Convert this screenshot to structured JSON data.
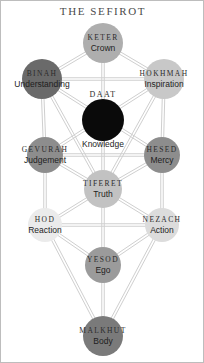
{
  "page": {
    "title": "THE SEFIROT",
    "background_color": "#ffffff",
    "border_color": "#bdbdbd",
    "title_color": "#4a4a4a",
    "path_color": "#cfcfcf",
    "width": 204,
    "height": 363
  },
  "diagram_data": {
    "type": "diagram",
    "name": "Tree of Life (Kabbalah) — The Sefirot",
    "nodes": [
      {
        "id": "keter",
        "name": "KETER",
        "meaning": "Crown",
        "cx": 102,
        "cy": 42,
        "r": 20,
        "fill": "#aeaeae",
        "name_color": "#2b2b2b",
        "meaning_color": "#1e1e1e",
        "name_size": 7.5,
        "meaning_size": 8.5,
        "name_dy": -5,
        "meaning_dy": 6
      },
      {
        "id": "binah",
        "name": "BINAH",
        "meaning": "Understanding",
        "cx": 41,
        "cy": 78,
        "r": 20,
        "fill": "#6a6a6a",
        "name_color": "#2b2b2b",
        "meaning_color": "#1e1e1e",
        "name_size": 7.5,
        "meaning_size": 8.5,
        "name_dy": -5,
        "meaning_dy": 6
      },
      {
        "id": "hokhmah",
        "name": "HOKHMAH",
        "meaning": "Inspiration",
        "cx": 163,
        "cy": 78,
        "r": 20,
        "fill": "#c8c8c8",
        "name_color": "#2b2b2b",
        "meaning_color": "#1e1e1e",
        "name_size": 7.5,
        "meaning_size": 8.5,
        "name_dy": -5,
        "meaning_dy": 6
      },
      {
        "id": "daat",
        "name": "DAAT",
        "meaning": "Knowledge",
        "cx": 102,
        "cy": 119,
        "r": 21,
        "fill": "#0a0a0a",
        "name_color": "#2b2b2b",
        "meaning_color": "#1e1e1e",
        "name_size": 8,
        "meaning_size": 8.5,
        "name_dy": -25,
        "meaning_dy": 25
      },
      {
        "id": "gevurah",
        "name": "GEVURAH",
        "meaning": "Judgement",
        "cx": 44,
        "cy": 154,
        "r": 18,
        "fill": "#8d8d8d",
        "name_color": "#2b2b2b",
        "meaning_color": "#1e1e1e",
        "name_size": 7.5,
        "meaning_size": 8.5,
        "name_dy": -5,
        "meaning_dy": 6
      },
      {
        "id": "hesed",
        "name": "HESED",
        "meaning": "Mercy",
        "cx": 161,
        "cy": 154,
        "r": 18,
        "fill": "#8d8d8d",
        "name_color": "#2b2b2b",
        "meaning_color": "#1e1e1e",
        "name_size": 7.5,
        "meaning_size": 8.5,
        "name_dy": -5,
        "meaning_dy": 6
      },
      {
        "id": "tiferet",
        "name": "TIFERET",
        "meaning": "Truth",
        "cx": 102,
        "cy": 188,
        "r": 19,
        "fill": "#c2c2c2",
        "name_color": "#2b2b2b",
        "meaning_color": "#1e1e1e",
        "name_size": 7.5,
        "meaning_size": 8.5,
        "name_dy": -5,
        "meaning_dy": 6
      },
      {
        "id": "hod",
        "name": "HOD",
        "meaning": "Reaction",
        "cx": 44,
        "cy": 224,
        "r": 17,
        "fill": "#ebebeb",
        "name_color": "#2b2b2b",
        "meaning_color": "#1e1e1e",
        "name_size": 7.5,
        "meaning_size": 8.5,
        "name_dy": -5,
        "meaning_dy": 6
      },
      {
        "id": "nezach",
        "name": "NEZACH",
        "meaning": "Action",
        "cx": 161,
        "cy": 224,
        "r": 17,
        "fill": "#dcdcdc",
        "name_color": "#2b2b2b",
        "meaning_color": "#1e1e1e",
        "name_size": 7.5,
        "meaning_size": 8.5,
        "name_dy": -5,
        "meaning_dy": 6
      },
      {
        "id": "yesod",
        "name": "YESOD",
        "meaning": "Ego",
        "cx": 102,
        "cy": 264,
        "r": 18,
        "fill": "#9b9b9b",
        "name_color": "#2b2b2b",
        "meaning_color": "#1e1e1e",
        "name_size": 7.5,
        "meaning_size": 8.5,
        "name_dy": -5,
        "meaning_dy": 6
      },
      {
        "id": "malkhut",
        "name": "MALKHUT",
        "meaning": "Body",
        "cx": 102,
        "cy": 335,
        "r": 20,
        "fill": "#7a7a7a",
        "name_color": "#2b2b2b",
        "meaning_color": "#1e1e1e",
        "name_size": 7.5,
        "meaning_size": 8.5,
        "name_dy": -5,
        "meaning_dy": 6
      }
    ],
    "edges": [
      [
        "keter",
        "binah"
      ],
      [
        "keter",
        "hokhmah"
      ],
      [
        "keter",
        "tiferet"
      ],
      [
        "binah",
        "hokhmah"
      ],
      [
        "binah",
        "gevurah"
      ],
      [
        "binah",
        "tiferet"
      ],
      [
        "hokhmah",
        "hesed"
      ],
      [
        "hokhmah",
        "tiferet"
      ],
      [
        "binah",
        "hesed"
      ],
      [
        "hokhmah",
        "gevurah"
      ],
      [
        "gevurah",
        "hesed"
      ],
      [
        "gevurah",
        "tiferet"
      ],
      [
        "hesed",
        "tiferet"
      ],
      [
        "gevurah",
        "hod"
      ],
      [
        "hesed",
        "nezach"
      ],
      [
        "tiferet",
        "hod"
      ],
      [
        "tiferet",
        "nezach"
      ],
      [
        "tiferet",
        "yesod"
      ],
      [
        "hod",
        "nezach"
      ],
      [
        "hod",
        "yesod"
      ],
      [
        "nezach",
        "yesod"
      ],
      [
        "hod",
        "malkhut"
      ],
      [
        "nezach",
        "malkhut"
      ],
      [
        "yesod",
        "malkhut"
      ]
    ]
  }
}
